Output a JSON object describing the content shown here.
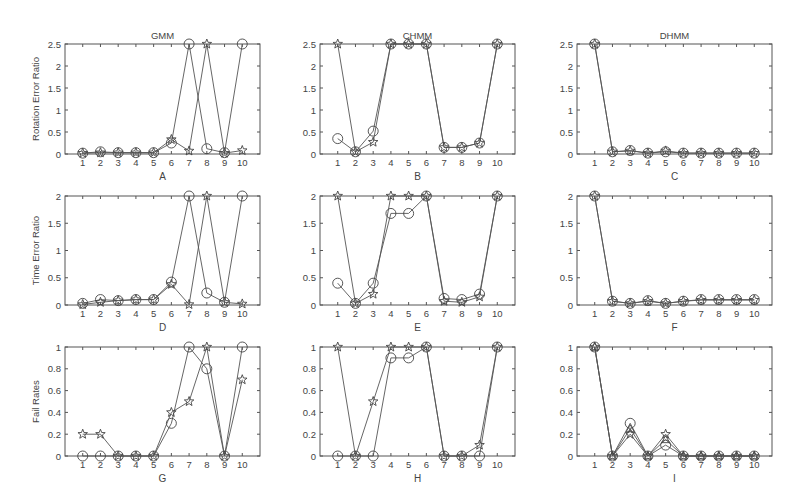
{
  "figure": {
    "column_titles": [
      "GMM",
      "CHMM",
      "DHMM"
    ],
    "row_ylabels": [
      "Rotation Error Ratio",
      "Time Error Ratio",
      "Fail Rates"
    ],
    "colors": {
      "axis": "#555555",
      "line": "#555555",
      "marker": "#444444",
      "background": "#ffffff"
    }
  },
  "chart_data": [
    {
      "id": "A",
      "type": "line",
      "title": "GMM",
      "xlabel": "A",
      "ylabel": "Rotation Error Ratio",
      "x": [
        1,
        2,
        3,
        4,
        5,
        6,
        7,
        8,
        9,
        10
      ],
      "xlim": [
        0,
        11
      ],
      "ylim": [
        0,
        2.5
      ],
      "yticks": [
        0,
        0.5,
        1,
        1.5,
        2,
        2.5
      ],
      "ytick_labels": [
        "0",
        "0.5",
        "1",
        "1.5",
        "2",
        "2.5"
      ],
      "grid": false,
      "series": [
        {
          "name": "circle",
          "marker": "circle",
          "values": [
            0.02,
            0.05,
            0.03,
            0.03,
            0.03,
            0.25,
            2.5,
            0.12,
            0.03,
            2.5
          ]
        },
        {
          "name": "star",
          "marker": "star",
          "values": [
            0.02,
            0.03,
            0.03,
            0.03,
            0.03,
            0.33,
            0.07,
            2.5,
            0.02,
            0.08
          ]
        }
      ]
    },
    {
      "id": "B",
      "type": "line",
      "title": "CHMM",
      "xlabel": "B",
      "ylabel": "",
      "x": [
        1,
        2,
        3,
        4,
        5,
        6,
        7,
        8,
        9,
        10
      ],
      "xlim": [
        0,
        11
      ],
      "ylim": [
        0,
        2.5
      ],
      "yticks": [
        0,
        0.5,
        1,
        1.5,
        2,
        2.5
      ],
      "ytick_labels": [
        "0",
        "0.5",
        "1",
        "1.5",
        "2",
        "2.5"
      ],
      "grid": false,
      "series": [
        {
          "name": "circle",
          "marker": "circle",
          "values": [
            0.35,
            0.05,
            0.52,
            2.5,
            2.5,
            2.5,
            0.15,
            0.15,
            0.25,
            2.5
          ]
        },
        {
          "name": "star",
          "marker": "star",
          "values": [
            2.5,
            0.05,
            0.27,
            2.5,
            2.5,
            2.5,
            0.15,
            0.15,
            0.25,
            2.5
          ]
        }
      ]
    },
    {
      "id": "C",
      "type": "line",
      "title": "DHMM",
      "xlabel": "C",
      "ylabel": "",
      "x": [
        1,
        2,
        3,
        4,
        5,
        6,
        7,
        8,
        9,
        10
      ],
      "xlim": [
        0,
        11
      ],
      "ylim": [
        0,
        2.5
      ],
      "yticks": [
        0,
        0.5,
        1,
        1.5,
        2,
        2.5
      ],
      "ytick_labels": [
        "0",
        "0.5",
        "1",
        "1.5",
        "2",
        "2.5"
      ],
      "grid": false,
      "series": [
        {
          "name": "circle",
          "marker": "circle",
          "values": [
            2.5,
            0.05,
            0.08,
            0.02,
            0.05,
            0.02,
            0.02,
            0.02,
            0.02,
            0.02
          ]
        },
        {
          "name": "star",
          "marker": "star",
          "values": [
            2.5,
            0.05,
            0.07,
            0.02,
            0.07,
            0.02,
            0.02,
            0.02,
            0.02,
            0.02
          ]
        }
      ]
    },
    {
      "id": "D",
      "type": "line",
      "title": "",
      "xlabel": "D",
      "ylabel": "Time Error Ratio",
      "x": [
        1,
        2,
        3,
        4,
        5,
        6,
        7,
        8,
        9,
        10
      ],
      "xlim": [
        0,
        11
      ],
      "ylim": [
        0,
        2
      ],
      "yticks": [
        0,
        0.5,
        1,
        1.5,
        2
      ],
      "ytick_labels": [
        "0",
        "0.5",
        "1",
        "1.5",
        "2"
      ],
      "grid": false,
      "series": [
        {
          "name": "circle",
          "marker": "circle",
          "values": [
            0.03,
            0.1,
            0.08,
            0.1,
            0.1,
            0.42,
            2.0,
            0.22,
            0.05,
            2.0
          ]
        },
        {
          "name": "star",
          "marker": "star",
          "values": [
            0.01,
            0.05,
            0.08,
            0.1,
            0.1,
            0.38,
            0.01,
            2.0,
            0.05,
            0.02
          ]
        }
      ]
    },
    {
      "id": "E",
      "type": "line",
      "title": "",
      "xlabel": "E",
      "ylabel": "",
      "x": [
        1,
        2,
        3,
        4,
        5,
        6,
        7,
        8,
        9,
        10
      ],
      "xlim": [
        0,
        11
      ],
      "ylim": [
        0,
        2
      ],
      "yticks": [
        0,
        0.5,
        1,
        1.5,
        2
      ],
      "ytick_labels": [
        "0",
        "0.5",
        "1",
        "1.5",
        "2"
      ],
      "grid": false,
      "series": [
        {
          "name": "circle",
          "marker": "circle",
          "values": [
            0.4,
            0.03,
            0.4,
            1.68,
            1.68,
            2.0,
            0.12,
            0.1,
            0.2,
            2.0
          ]
        },
        {
          "name": "star",
          "marker": "star",
          "values": [
            2.0,
            0.03,
            0.2,
            2.0,
            2.0,
            2.0,
            0.07,
            0.05,
            0.15,
            2.0
          ]
        }
      ]
    },
    {
      "id": "F",
      "type": "line",
      "title": "",
      "xlabel": "F",
      "ylabel": "",
      "x": [
        1,
        2,
        3,
        4,
        5,
        6,
        7,
        8,
        9,
        10
      ],
      "xlim": [
        0,
        11
      ],
      "ylim": [
        0,
        2
      ],
      "yticks": [
        0,
        0.5,
        1,
        1.5,
        2
      ],
      "ytick_labels": [
        "0",
        "0.5",
        "1",
        "1.5",
        "2"
      ],
      "grid": false,
      "series": [
        {
          "name": "circle",
          "marker": "circle",
          "values": [
            2.0,
            0.07,
            0.03,
            0.08,
            0.03,
            0.07,
            0.1,
            0.1,
            0.1,
            0.1
          ]
        },
        {
          "name": "star",
          "marker": "star",
          "values": [
            2.0,
            0.07,
            0.03,
            0.07,
            0.03,
            0.07,
            0.09,
            0.09,
            0.09,
            0.09
          ]
        }
      ]
    },
    {
      "id": "G",
      "type": "line",
      "title": "",
      "xlabel": "G",
      "ylabel": "Fail Rates",
      "x": [
        1,
        2,
        3,
        4,
        5,
        6,
        7,
        8,
        9,
        10
      ],
      "xlim": [
        0,
        11
      ],
      "ylim": [
        0,
        1
      ],
      "yticks": [
        0,
        0.2,
        0.4,
        0.6,
        0.8,
        1
      ],
      "ytick_labels": [
        "0",
        "0.2",
        "0.4",
        "0.6",
        "0.8",
        "1"
      ],
      "grid": false,
      "series": [
        {
          "name": "circle",
          "marker": "circle",
          "values": [
            0,
            0,
            0,
            0,
            0,
            0.3,
            1.0,
            0.8,
            0,
            1.0
          ]
        },
        {
          "name": "star",
          "marker": "star",
          "values": [
            0.2,
            0.2,
            0,
            0,
            0,
            0.4,
            0.5,
            1.0,
            0,
            0.7
          ]
        }
      ]
    },
    {
      "id": "H",
      "type": "line",
      "title": "",
      "xlabel": "H",
      "ylabel": "",
      "x": [
        1,
        2,
        3,
        4,
        5,
        6,
        7,
        8,
        9,
        10
      ],
      "xlim": [
        0,
        11
      ],
      "ylim": [
        0,
        1
      ],
      "yticks": [
        0,
        0.2,
        0.4,
        0.6,
        0.8,
        1
      ],
      "ytick_labels": [
        "0",
        "0.2",
        "0.4",
        "0.6",
        "0.8",
        "1"
      ],
      "grid": false,
      "series": [
        {
          "name": "circle",
          "marker": "circle",
          "values": [
            0,
            0,
            0,
            0.9,
            0.9,
            1.0,
            0,
            0,
            0,
            1.0
          ]
        },
        {
          "name": "star",
          "marker": "star",
          "values": [
            1.0,
            0,
            0.5,
            1.0,
            1.0,
            1.0,
            0,
            0,
            0.1,
            1.0
          ]
        }
      ]
    },
    {
      "id": "I",
      "type": "line",
      "title": "",
      "xlabel": "I",
      "ylabel": "",
      "x": [
        1,
        2,
        3,
        4,
        5,
        6,
        7,
        8,
        9,
        10
      ],
      "xlim": [
        0,
        11
      ],
      "ylim": [
        0,
        1
      ],
      "yticks": [
        0,
        0.2,
        0.4,
        0.6,
        0.8,
        1
      ],
      "ytick_labels": [
        "0",
        "0.2",
        "0.4",
        "0.6",
        "0.8",
        "1"
      ],
      "grid": false,
      "series": [
        {
          "name": "circle",
          "marker": "circle",
          "values": [
            1.0,
            0,
            0.3,
            0,
            0.1,
            0,
            0,
            0,
            0,
            0
          ]
        },
        {
          "name": "star",
          "marker": "star",
          "values": [
            1.0,
            0,
            0.2,
            0,
            0.2,
            0,
            0,
            0,
            0,
            0
          ]
        },
        {
          "name": "triangle",
          "marker": "triangle",
          "values": [
            1.0,
            0,
            0.25,
            0,
            0.15,
            0,
            0,
            0,
            0,
            0
          ]
        }
      ]
    }
  ]
}
